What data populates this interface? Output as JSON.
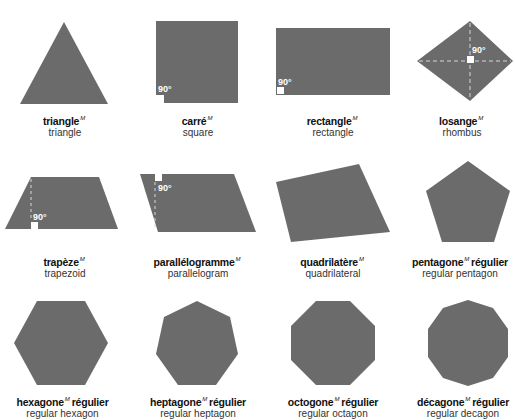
{
  "colors": {
    "shape_fill": "#6b6b6b",
    "marker": "#ffffff",
    "text_fr": "#111111",
    "text_en": "#333333"
  },
  "angle_label": "90°",
  "shapes": [
    {
      "fr": "triangle",
      "gender": "M",
      "fr_suffix": "",
      "en": "triangle"
    },
    {
      "fr": "carré",
      "gender": "M",
      "fr_suffix": "",
      "en": "square"
    },
    {
      "fr": "rectangle",
      "gender": "M",
      "fr_suffix": "",
      "en": "rectangle"
    },
    {
      "fr": "losange",
      "gender": "M",
      "fr_suffix": "",
      "en": "rhombus"
    },
    {
      "fr": "trapèze",
      "gender": "M",
      "fr_suffix": "",
      "en": "trapezoid"
    },
    {
      "fr": "parallélogramme",
      "gender": "M",
      "fr_suffix": "",
      "en": "parallelogram"
    },
    {
      "fr": "quadrilatère",
      "gender": "M",
      "fr_suffix": "",
      "en": "quadrilateral"
    },
    {
      "fr": "pentagone",
      "gender": "M",
      "fr_suffix": "régulier",
      "en": "regular pentagon"
    },
    {
      "fr": "hexagone",
      "gender": "M",
      "fr_suffix": "régulier",
      "en": "regular hexagon"
    },
    {
      "fr": "heptagone",
      "gender": "M",
      "fr_suffix": "régulier",
      "en": "regular heptagon"
    },
    {
      "fr": "octogone",
      "gender": "M",
      "fr_suffix": "régulier",
      "en": "regular octagon"
    },
    {
      "fr": "décagone",
      "gender": "M",
      "fr_suffix": "régulier",
      "en": "regular decagon"
    }
  ]
}
